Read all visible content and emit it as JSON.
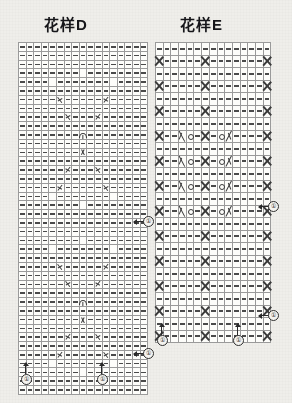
{
  "page": {
    "background_color": "#efeeea",
    "ink_color": "#1a1a1a"
  },
  "charts": [
    {
      "id": "chart-d",
      "title": "花样D",
      "columns": 17,
      "rows": 40,
      "legend_symbols": [
        "dash",
        "fill",
        "twist-left",
        "twist-right",
        "center-y",
        "center-a"
      ],
      "markers": [
        {
          "label": "①",
          "position": "right-middle"
        },
        {
          "label": "①",
          "position": "right-bottom"
        },
        {
          "label": "①",
          "position": "bottom-left"
        },
        {
          "label": "①",
          "position": "bottom-center"
        }
      ],
      "cells": [
        [
          "-",
          "-",
          "-",
          "-",
          "-",
          "-",
          "-",
          "-",
          "-",
          "-",
          "-",
          "-",
          "-",
          "-",
          "-",
          "-",
          "-"
        ],
        [
          "-",
          "-",
          "-",
          "-",
          "-",
          "-",
          "-",
          "-",
          "-",
          "-",
          "-",
          "-",
          "-",
          "-",
          "-",
          "-",
          "-"
        ],
        [
          "-",
          "-",
          "-",
          "-",
          "-",
          "-",
          "-",
          "-",
          "-",
          "-",
          "-",
          "-",
          "-",
          "-",
          "-",
          "-",
          "-"
        ],
        [
          "-",
          "-",
          "-",
          "-",
          "-",
          "-",
          "-",
          "-",
          "#",
          "-",
          "-",
          "-",
          "-",
          "-",
          "-",
          "-",
          "-"
        ],
        [
          "-",
          "-",
          "-",
          "-",
          "#",
          "-",
          "-",
          "-",
          "-",
          "-",
          "-",
          "-",
          "#",
          "-",
          "-",
          "-",
          "-"
        ],
        [
          "-",
          "-",
          "-",
          "-",
          "-",
          "-",
          "-",
          "-",
          "-",
          "-",
          "-",
          "-",
          "-",
          "-",
          "-",
          "-",
          "-"
        ],
        [
          "-",
          "-",
          "-",
          "-",
          "-",
          "x",
          "-",
          "-",
          "-",
          "-",
          "-",
          "X",
          "-",
          "-",
          "-",
          "-",
          "-"
        ],
        [
          "-",
          "-",
          "-",
          "-",
          "-",
          "-",
          "-",
          "-",
          "-",
          "-",
          "-",
          "-",
          "-",
          "-",
          "-",
          "-",
          "-"
        ],
        [
          "-",
          "-",
          "-",
          "-",
          "-",
          "-",
          "x",
          "-",
          "-",
          "-",
          "X",
          "-",
          "-",
          "-",
          "-",
          "-",
          "-"
        ],
        [
          "-",
          "-",
          "-",
          "-",
          "-",
          "-",
          "-",
          "-",
          "-",
          "-",
          "-",
          "-",
          "-",
          "-",
          "-",
          "-",
          "-"
        ],
        [
          "-",
          "-",
          "-",
          "-",
          "-",
          "-",
          "-",
          "-",
          "Y",
          "-",
          "-",
          "-",
          "-",
          "-",
          "-",
          "-",
          "-"
        ],
        [
          "-",
          "-",
          "-",
          "-",
          "-",
          "-",
          "-",
          "-",
          "-",
          "-",
          "-",
          "-",
          "-",
          "-",
          "-",
          "-",
          "-"
        ],
        [
          "-",
          "-",
          "-",
          "-",
          "-",
          "-",
          "-",
          "-",
          "A",
          "-",
          "-",
          "-",
          "-",
          "-",
          "-",
          "-",
          "-"
        ],
        [
          "-",
          "-",
          "-",
          "-",
          "-",
          "-",
          "-",
          "-",
          "-",
          "-",
          "-",
          "-",
          "-",
          "-",
          "-",
          "-",
          "-"
        ],
        [
          "-",
          "-",
          "-",
          "-",
          "-",
          "-",
          "X",
          "-",
          "-",
          "-",
          "x",
          "-",
          "-",
          "-",
          "-",
          "-",
          "-"
        ],
        [
          "-",
          "-",
          "-",
          "-",
          "-",
          "-",
          "-",
          "-",
          "-",
          "-",
          "-",
          "-",
          "-",
          "-",
          "-",
          "-",
          "-"
        ],
        [
          "-",
          "-",
          "-",
          "-",
          "-",
          "X",
          "-",
          "-",
          "-",
          "-",
          "-",
          "x",
          "-",
          "-",
          "-",
          "-",
          "-"
        ],
        [
          "-",
          "-",
          "-",
          "-",
          "#",
          "-",
          "-",
          "-",
          "-",
          "-",
          "-",
          "-",
          "#",
          "-",
          "-",
          "-",
          "-"
        ],
        [
          "-",
          "-",
          "-",
          "-",
          "-",
          "-",
          "-",
          "-",
          "#",
          "-",
          "-",
          "-",
          "-",
          "-",
          "-",
          "-",
          "-"
        ],
        [
          "-",
          "-",
          "-",
          "-",
          "-",
          "-",
          "-",
          "-",
          "-",
          "-",
          "-",
          "-",
          "-",
          "-",
          "-",
          "-",
          "-"
        ],
        [
          "-",
          "-",
          "-",
          "-",
          "-",
          "-",
          "-",
          "-",
          "-",
          "-",
          "-",
          "-",
          "-",
          "-",
          "-",
          "-",
          "-"
        ],
        [
          "-",
          "-",
          "-",
          "-",
          "-",
          "-",
          "-",
          "-",
          "-",
          "-",
          "-",
          "-",
          "-",
          "-",
          "-",
          "-",
          "-"
        ],
        [
          "-",
          "-",
          "-",
          "-",
          "-",
          "-",
          "-",
          "-",
          "#",
          "-",
          "-",
          "-",
          "-",
          "-",
          "-",
          "-",
          "-"
        ],
        [
          "-",
          "-",
          "-",
          "-",
          "#",
          "-",
          "-",
          "-",
          "-",
          "-",
          "-",
          "-",
          "#",
          "-",
          "-",
          "-",
          "-"
        ],
        [
          "-",
          "-",
          "-",
          "-",
          "-",
          "-",
          "-",
          "-",
          "-",
          "-",
          "-",
          "-",
          "-",
          "-",
          "-",
          "-",
          "-"
        ],
        [
          "-",
          "-",
          "-",
          "-",
          "-",
          "x",
          "-",
          "-",
          "-",
          "-",
          "-",
          "X",
          "-",
          "-",
          "-",
          "-",
          "-"
        ],
        [
          "-",
          "-",
          "-",
          "-",
          "-",
          "-",
          "-",
          "-",
          "-",
          "-",
          "-",
          "-",
          "-",
          "-",
          "-",
          "-",
          "-"
        ],
        [
          "-",
          "-",
          "-",
          "-",
          "-",
          "-",
          "x",
          "-",
          "-",
          "-",
          "X",
          "-",
          "-",
          "-",
          "-",
          "-",
          "-"
        ],
        [
          "-",
          "-",
          "-",
          "-",
          "-",
          "-",
          "-",
          "-",
          "-",
          "-",
          "-",
          "-",
          "-",
          "-",
          "-",
          "-",
          "-"
        ],
        [
          "-",
          "-",
          "-",
          "-",
          "-",
          "-",
          "-",
          "-",
          "Y",
          "-",
          "-",
          "-",
          "-",
          "-",
          "-",
          "-",
          "-"
        ],
        [
          "-",
          "-",
          "-",
          "-",
          "-",
          "-",
          "-",
          "-",
          "-",
          "-",
          "-",
          "-",
          "-",
          "-",
          "-",
          "-",
          "-"
        ],
        [
          "-",
          "-",
          "-",
          "-",
          "-",
          "-",
          "-",
          "-",
          "A",
          "-",
          "-",
          "-",
          "-",
          "-",
          "-",
          "-",
          "-"
        ],
        [
          "-",
          "-",
          "-",
          "-",
          "-",
          "-",
          "-",
          "-",
          "-",
          "-",
          "-",
          "-",
          "-",
          "-",
          "-",
          "-",
          "-"
        ],
        [
          "-",
          "-",
          "-",
          "-",
          "-",
          "-",
          "X",
          "-",
          "-",
          "-",
          "x",
          "-",
          "-",
          "-",
          "-",
          "-",
          "-"
        ],
        [
          "-",
          "-",
          "-",
          "-",
          "-",
          "-",
          "-",
          "-",
          "-",
          "-",
          "-",
          "-",
          "-",
          "-",
          "-",
          "-",
          "-"
        ],
        [
          "-",
          "-",
          "-",
          "-",
          "-",
          "X",
          "-",
          "-",
          "-",
          "-",
          "-",
          "x",
          "-",
          "-",
          "-",
          "-",
          "-"
        ],
        [
          "-",
          "-",
          "-",
          "-",
          "#",
          "-",
          "-",
          "-",
          "-",
          "-",
          "-",
          "-",
          "#",
          "-",
          "-",
          "-",
          "-"
        ],
        [
          "-",
          "-",
          "-",
          "-",
          "-",
          "-",
          "-",
          "-",
          "#",
          "-",
          "-",
          "-",
          "-",
          "-",
          "-",
          "-",
          "-"
        ],
        [
          "-",
          "-",
          "-",
          "-",
          "-",
          "-",
          "-",
          "-",
          "-",
          "-",
          "-",
          "-",
          "-",
          "-",
          "-",
          "-",
          "-"
        ],
        [
          "-",
          "-",
          "-",
          "-",
          "-",
          "-",
          "-",
          "-",
          "-",
          "-",
          "-",
          "-",
          "-",
          "-",
          "-",
          "-",
          "-"
        ]
      ]
    },
    {
      "id": "chart-e",
      "title": "花样E",
      "columns": 15,
      "rows": 24,
      "legend_symbols": [
        "dash",
        "cable-x",
        "yarn-over",
        "decrease-left",
        "decrease-right"
      ],
      "markers": [
        {
          "label": "①",
          "position": "right-middle"
        },
        {
          "label": "①",
          "position": "right-bottom"
        },
        {
          "label": "①",
          "position": "bottom-left"
        },
        {
          "label": "①",
          "position": "bottom-right"
        }
      ],
      "cells": [
        [
          "-",
          "-",
          "-",
          "-",
          "-",
          "-",
          "-",
          "-",
          "-",
          "-",
          "-",
          "-",
          "-",
          "-",
          "-"
        ],
        [
          "X",
          "-",
          "-",
          "-",
          "-",
          "-",
          "X",
          "-",
          "-",
          "-",
          "-",
          "-",
          "-",
          "-",
          "X"
        ],
        [
          "-",
          "-",
          "-",
          "-",
          "-",
          "-",
          "-",
          "-",
          "-",
          "-",
          "-",
          "-",
          "-",
          "-",
          "-"
        ],
        [
          "X",
          "-",
          "-",
          "-",
          "-",
          "-",
          "X",
          "-",
          "-",
          "-",
          "-",
          "-",
          "-",
          "-",
          "X"
        ],
        [
          "-",
          "-",
          "-",
          "-",
          "-",
          "-",
          "-",
          "-",
          "-",
          "-",
          "-",
          "-",
          "-",
          "-",
          "-"
        ],
        [
          "X",
          "-",
          "-",
          "-",
          "-",
          "-",
          "X",
          "-",
          "-",
          "-",
          "-",
          "-",
          "-",
          "-",
          "X"
        ],
        [
          "-",
          "-",
          "-",
          "-",
          "-",
          "-",
          "-",
          "-",
          "-",
          "-",
          "-",
          "-",
          "-",
          "-",
          "-"
        ],
        [
          "X",
          "-",
          "-",
          "\\",
          "o",
          "-",
          "X",
          "-",
          "o",
          "/",
          "-",
          "-",
          "-",
          "-",
          "X"
        ],
        [
          "-",
          "-",
          "-",
          "-",
          "-",
          "-",
          "-",
          "-",
          "-",
          "-",
          "-",
          "-",
          "-",
          "-",
          "-"
        ],
        [
          "X",
          "-",
          "-",
          "\\",
          "o",
          "-",
          "X",
          "-",
          "o",
          "/",
          "-",
          "-",
          "-",
          "-",
          "X"
        ],
        [
          "-",
          "-",
          "-",
          "-",
          "-",
          "-",
          "-",
          "-",
          "-",
          "-",
          "-",
          "-",
          "-",
          "-",
          "-"
        ],
        [
          "X",
          "-",
          "-",
          "\\",
          "o",
          "-",
          "X",
          "-",
          "o",
          "/",
          "-",
          "-",
          "-",
          "-",
          "X"
        ],
        [
          "-",
          "-",
          "-",
          "-",
          "-",
          "-",
          "-",
          "-",
          "-",
          "-",
          "-",
          "-",
          "-",
          "-",
          "-"
        ],
        [
          "X",
          "-",
          "-",
          "\\",
          "o",
          "-",
          "X",
          "-",
          "o",
          "/",
          "-",
          "-",
          "-",
          "-",
          "X"
        ],
        [
          "-",
          "-",
          "-",
          "-",
          "-",
          "-",
          "-",
          "-",
          "-",
          "-",
          "-",
          "-",
          "-",
          "-",
          "-"
        ],
        [
          "X",
          "-",
          "-",
          "-",
          "-",
          "-",
          "X",
          "-",
          "-",
          "-",
          "-",
          "-",
          "-",
          "-",
          "X"
        ],
        [
          "-",
          "-",
          "-",
          "-",
          "-",
          "-",
          "-",
          "-",
          "-",
          "-",
          "-",
          "-",
          "-",
          "-",
          "-"
        ],
        [
          "X",
          "-",
          "-",
          "-",
          "-",
          "-",
          "X",
          "-",
          "-",
          "-",
          "-",
          "-",
          "-",
          "-",
          "X"
        ],
        [
          "-",
          "-",
          "-",
          "-",
          "-",
          "-",
          "-",
          "-",
          "-",
          "-",
          "-",
          "-",
          "-",
          "-",
          "-"
        ],
        [
          "X",
          "-",
          "-",
          "-",
          "-",
          "-",
          "X",
          "-",
          "-",
          "-",
          "-",
          "-",
          "-",
          "-",
          "X"
        ],
        [
          "-",
          "-",
          "-",
          "-",
          "-",
          "-",
          "-",
          "-",
          "-",
          "-",
          "-",
          "-",
          "-",
          "-",
          "-"
        ],
        [
          "X",
          "-",
          "-",
          "-",
          "-",
          "-",
          "X",
          "-",
          "-",
          "-",
          "-",
          "-",
          "-",
          "-",
          "X"
        ],
        [
          "-",
          "-",
          "-",
          "-",
          "-",
          "-",
          "-",
          "-",
          "-",
          "-",
          "-",
          "-",
          "-",
          "-",
          "-"
        ],
        [
          "X",
          "-",
          "-",
          "-",
          "-",
          "-",
          "X",
          "-",
          "-",
          "-",
          "-",
          "-",
          "-",
          "-",
          "X"
        ]
      ]
    }
  ]
}
